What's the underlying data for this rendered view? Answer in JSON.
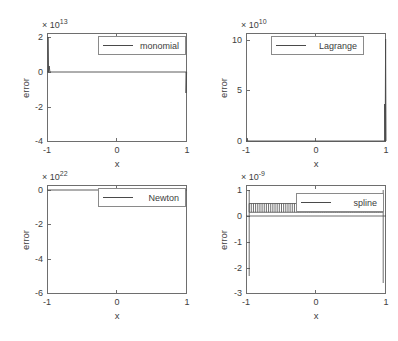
{
  "figure": {
    "background": "#ffffff",
    "axis_color": "#6e6e6e",
    "line_color": "#4a4a4a",
    "text_color": "#3d3d3d"
  },
  "chart_data": [
    {
      "type": "line",
      "name": "monomial",
      "title": "",
      "xlabel": "x",
      "ylabel": "error",
      "legend": "monomial",
      "legend_position": "north-east-inside",
      "grid": false,
      "y_exponent_label": "× 10",
      "y_exponent_power": "13",
      "y_scale": 10000000000000.0,
      "xlim": [
        -1,
        1
      ],
      "ylim": [
        -4,
        2
      ],
      "xticks": [
        -1,
        0,
        1
      ],
      "xticklabels": [
        "-1",
        "0",
        "1"
      ],
      "yticks": [
        2,
        0,
        -2,
        -4
      ],
      "yticklabels": [
        "2",
        "0",
        "-2",
        "-4"
      ],
      "x": [
        -1.0,
        -0.995,
        -0.99,
        -0.985,
        -0.98,
        -0.97,
        -0.95,
        -0.9,
        -0.7,
        -0.4,
        0.0,
        0.4,
        0.7,
        0.9,
        0.95,
        0.97,
        0.98,
        0.985,
        0.99,
        0.995,
        1.0
      ],
      "y": [
        0.0,
        1.95,
        0.9,
        0.25,
        0.05,
        0.0,
        0.0,
        0.0,
        0.0,
        0.0,
        0.0,
        0.0,
        0.0,
        0.0,
        0.0,
        0.0,
        0.0,
        -0.1,
        -0.6,
        -1.2,
        0.0
      ]
    },
    {
      "type": "line",
      "name": "Lagrange",
      "title": "",
      "xlabel": "x",
      "ylabel": "error",
      "legend": "Lagrange",
      "legend_position": "north-east-inside",
      "grid": false,
      "y_exponent_label": "× 10",
      "y_exponent_power": "10",
      "y_scale": 10000000000.0,
      "xlim": [
        -1,
        1
      ],
      "ylim": [
        0,
        11
      ],
      "xticks": [
        -1,
        0,
        1
      ],
      "xticklabels": [
        "-1",
        "0",
        "1"
      ],
      "yticks": [
        10,
        5,
        0
      ],
      "yticklabels": [
        "10",
        "5",
        "0"
      ],
      "x": [
        -1.0,
        -0.998,
        -0.995,
        -0.99,
        -0.98,
        -0.95,
        -0.9,
        -0.5,
        0.0,
        0.5,
        0.9,
        0.95,
        0.98,
        0.99,
        0.995,
        0.998,
        1.0
      ],
      "y": [
        0.0,
        0.3,
        0.15,
        0.05,
        0.0,
        0.0,
        0.0,
        0.0,
        0.0,
        0.0,
        0.0,
        0.0,
        0.05,
        0.3,
        4.0,
        10.9,
        0.0
      ]
    },
    {
      "type": "line",
      "name": "Newton",
      "title": "",
      "xlabel": "x",
      "ylabel": "error",
      "legend": "Newton",
      "legend_position": "north-east-inside",
      "grid": false,
      "y_exponent_label": "× 10",
      "y_exponent_power": "22",
      "y_scale": 1e+22,
      "xlim": [
        -1,
        1
      ],
      "ylim": [
        -6,
        0
      ],
      "xticks": [
        -1,
        0,
        1
      ],
      "xticklabels": [
        "-1",
        "0",
        "1"
      ],
      "yticks": [
        0,
        -2,
        -4,
        -6
      ],
      "yticklabels": [
        "0",
        "-2",
        "-4",
        "-6"
      ],
      "x": [
        -1.0,
        -0.99,
        -0.95,
        -0.9,
        -0.5,
        0.0,
        0.5,
        0.9,
        0.95,
        0.99,
        1.0
      ],
      "y": [
        0.0,
        0.0,
        0.0,
        0.0,
        0.0,
        0.0,
        0.0,
        0.0,
        0.0,
        0.0,
        0.0
      ]
    },
    {
      "type": "line",
      "name": "spline",
      "title": "",
      "xlabel": "x",
      "ylabel": "error",
      "legend": "spline",
      "legend_position": "north-east-inside",
      "grid": false,
      "y_exponent_label": "× 10",
      "y_exponent_power": "-9",
      "y_scale": 1e-09,
      "xlim": [
        -1,
        1
      ],
      "ylim": [
        -3,
        1
      ],
      "xticks": [
        -1,
        0,
        1
      ],
      "xticklabels": [
        "-1",
        "0",
        "1"
      ],
      "yticks": [
        1,
        0,
        -1,
        -2,
        -3
      ],
      "yticklabels": [
        "1",
        "0",
        "-1",
        "-2",
        "-3"
      ],
      "oscillation": {
        "band_low": 0.0,
        "band_high": 0.32,
        "x_start": -0.955,
        "x_end": 0.955,
        "cycles": 62
      },
      "spikes": [
        {
          "x": -0.985,
          "y_min": -2.35,
          "y_max": 1.0
        },
        {
          "x": 0.985,
          "y_min": -2.6,
          "y_max": 1.0
        }
      ]
    }
  ]
}
